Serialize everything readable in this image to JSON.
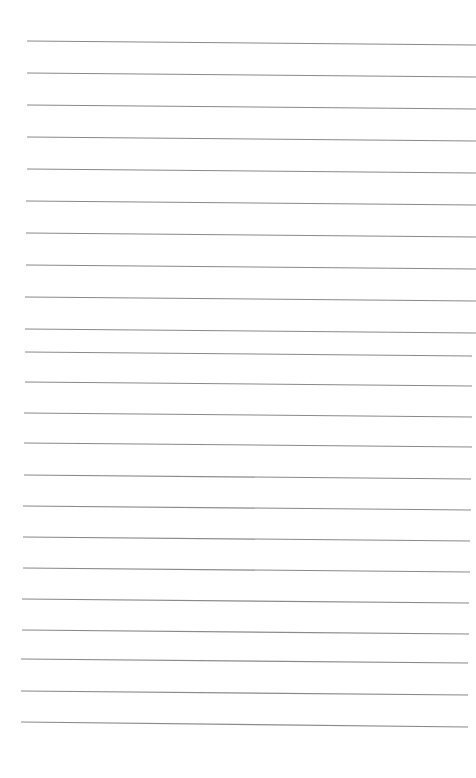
{
  "page": {
    "type": "lined-paper",
    "background_color": "#ffffff",
    "line_color": "#8a8a8a",
    "line_count": 22,
    "lines": [
      {
        "x1": 27,
        "y1": 41,
        "x2": 476,
        "y2": 45
      },
      {
        "x1": 27,
        "y1": 73,
        "x2": 476,
        "y2": 77
      },
      {
        "x1": 27,
        "y1": 105,
        "x2": 476,
        "y2": 109
      },
      {
        "x1": 27,
        "y1": 137,
        "x2": 476,
        "y2": 141
      },
      {
        "x1": 27,
        "y1": 169,
        "x2": 476,
        "y2": 173
      },
      {
        "x1": 26,
        "y1": 201,
        "x2": 476,
        "y2": 205
      },
      {
        "x1": 26,
        "y1": 233,
        "x2": 476,
        "y2": 237
      },
      {
        "x1": 26,
        "y1": 265,
        "x2": 476,
        "y2": 269
      },
      {
        "x1": 25,
        "y1": 297,
        "x2": 476,
        "y2": 301
      },
      {
        "x1": 25,
        "y1": 329,
        "x2": 476,
        "y2": 333
      },
      {
        "x1": 25,
        "y1": 352,
        "x2": 472,
        "y2": 356
      },
      {
        "x1": 25,
        "y1": 382,
        "x2": 472,
        "y2": 386
      },
      {
        "x1": 24,
        "y1": 413,
        "x2": 472,
        "y2": 417
      },
      {
        "x1": 24,
        "y1": 443,
        "x2": 472,
        "y2": 447
      },
      {
        "x1": 24,
        "y1": 475,
        "x2": 471,
        "y2": 479
      },
      {
        "x1": 23,
        "y1": 506,
        "x2": 471,
        "y2": 510
      },
      {
        "x1": 23,
        "y1": 537,
        "x2": 470,
        "y2": 541
      },
      {
        "x1": 23,
        "y1": 568,
        "x2": 470,
        "y2": 572
      },
      {
        "x1": 22,
        "y1": 599,
        "x2": 469,
        "y2": 603
      },
      {
        "x1": 22,
        "y1": 630,
        "x2": 469,
        "y2": 634
      },
      {
        "x1": 21,
        "y1": 659,
        "x2": 468,
        "y2": 663
      },
      {
        "x1": 21,
        "y1": 691,
        "x2": 468,
        "y2": 695
      },
      {
        "x1": 21,
        "y1": 722,
        "x2": 468,
        "y2": 727
      }
    ]
  }
}
